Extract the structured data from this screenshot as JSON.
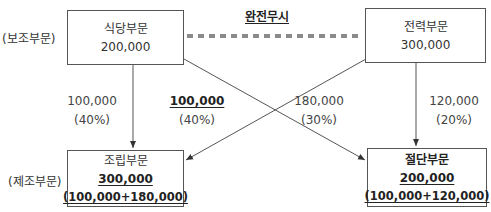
{
  "side_labels": {
    "support": "(보조부문)",
    "production": "(제조부문)"
  },
  "ignore_label": "완전무시",
  "boxes": {
    "cafeteria": {
      "name": "식당부문",
      "amount": "200,000"
    },
    "power": {
      "name": "전력부문",
      "amount": "300,000"
    },
    "assembly": {
      "name": "조립부문",
      "amount": "300,000",
      "breakdown": "(100,000+180,000)"
    },
    "cutting": {
      "name": "절단부문",
      "amount": "200,000",
      "breakdown": "(100,000+120,000)"
    }
  },
  "flows": {
    "cafeteria_to_assembly": {
      "amount": "100,000",
      "pct": "(40%)"
    },
    "cafeteria_to_cutting": {
      "amount": "100,000",
      "pct": "(40%)"
    },
    "power_to_assembly": {
      "amount": "180,000",
      "pct": "(30%)"
    },
    "power_to_cutting": {
      "amount": "120,000",
      "pct": "(20%)"
    }
  },
  "colors": {
    "line": "#555555",
    "dash": "#8a8a8a"
  }
}
